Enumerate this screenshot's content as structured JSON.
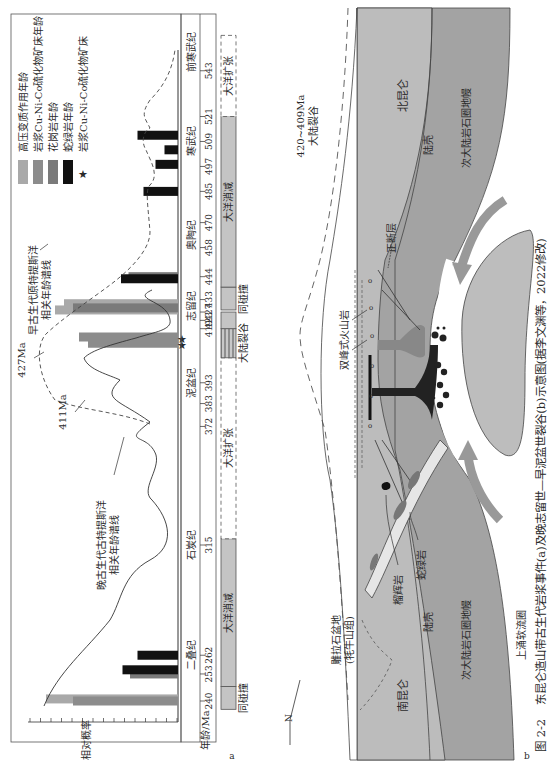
{
  "caption": {
    "figure_no": "图 2-2",
    "text": "东昆仑造山带古生代岩浆事件(a)及晚志留世—早泥盆世裂谷(b)示意图(据李文渊等，2022修改)"
  },
  "panel_a": {
    "label": "a",
    "legend": [
      {
        "label": "高压变质作用年龄",
        "color": "#a9a9a9",
        "kind": "bar"
      },
      {
        "label": "岩浆Cu-Ni-Co硫化物矿床年龄",
        "color": "#8c8c8c",
        "kind": "bar"
      },
      {
        "label": "花岗岩年龄",
        "color": "#7a7a7a",
        "kind": "bar"
      },
      {
        "label": "蛇绿岩年龄",
        "color": "#111111",
        "kind": "bar"
      },
      {
        "label": "岩浆Cu-Ni-Co硫化物矿床",
        "color": "#111111",
        "kind": "star"
      }
    ],
    "y_axis_label": "相对概率",
    "x_axis_label": "年龄/Ma",
    "annotations": {
      "peak_427": "427Ma",
      "peak_411": "411Ma",
      "early_curve": [
        "早古生代原特提斯洋",
        "相关年龄谱线"
      ],
      "late_curve": [
        "晚古生代古特提斯洋",
        "相关年龄谱线"
      ]
    },
    "age_ticks": [
      "240",
      "253",
      "262",
      "315",
      "372",
      "383",
      "393",
      "419",
      "423",
      "427",
      "433",
      "444",
      "458",
      "470",
      "485",
      "497",
      "509",
      "521",
      "543"
    ],
    "periods": [
      {
        "label": "二叠纪",
        "pos": 262
      },
      {
        "label": "石炭纪",
        "pos": 315
      },
      {
        "label": "泥盆纪",
        "pos": 393
      },
      {
        "label": "志留纪",
        "pos": 430
      },
      {
        "label": "奥陶纪",
        "pos": 464
      },
      {
        "label": "寒武纪",
        "pos": 509
      },
      {
        "label": "前寒武纪",
        "pos": 552
      }
    ],
    "tectonic_stages": [
      {
        "label": "同碰撞",
        "from": 236,
        "to": 247,
        "style": "box"
      },
      {
        "label": "大洋消减",
        "from": 247,
        "to": 318,
        "style": "filled"
      },
      {
        "label": "大洋扩张",
        "from": 318,
        "to": 405,
        "style": "dashed"
      },
      {
        "label": "大陆裂谷",
        "from": 405,
        "to": 419,
        "style": "hatched"
      },
      {
        "label": "",
        "from": 419,
        "to": 427,
        "style": "box"
      },
      {
        "label": "同碰撞",
        "from": 428,
        "to": 439,
        "style": "box"
      },
      {
        "label": "大洋消减",
        "from": 439,
        "to": 521,
        "style": "filled"
      },
      {
        "label": "大洋扩张",
        "from": 521,
        "to": 560,
        "style": "dashed"
      }
    ]
  },
  "chart_data": {
    "type": "bar",
    "title": "东昆仑造山带古生代岩浆事件",
    "xlabel": "年龄/Ma",
    "ylabel": "相对概率",
    "xlim": [
      236,
      560
    ],
    "series": [
      {
        "name": "高压变质作用年龄",
        "color": "#a9a9a9",
        "points": [
          {
            "age": 241,
            "value": 0.88
          },
          {
            "age": 428,
            "value": 0.82
          },
          {
            "age": 431,
            "value": 0.76
          }
        ]
      },
      {
        "name": "岩浆Cu-Ni-Co硫化物矿床年龄",
        "color": "#8c8c8c",
        "points": [
          {
            "age": 240,
            "value": 0.7
          },
          {
            "age": 412,
            "value": 0.6
          },
          {
            "age": 415,
            "value": 0.66
          }
        ]
      },
      {
        "name": "花岗岩年龄",
        "color": "#7a7a7a",
        "points": [
          {
            "age": 253,
            "value": 0.32
          },
          {
            "age": 429,
            "value": 0.7
          },
          {
            "age": 444,
            "value": 0.33
          }
        ]
      },
      {
        "name": "蛇绿岩年龄",
        "color": "#111111",
        "points": [
          {
            "age": 255,
            "value": 0.37
          },
          {
            "age": 262,
            "value": 0.27
          },
          {
            "age": 443,
            "value": 0.38
          },
          {
            "age": 485,
            "value": 0.23
          },
          {
            "age": 498,
            "value": 0.15
          },
          {
            "age": 505,
            "value": 0.09
          },
          {
            "age": 512,
            "value": 0.27
          }
        ]
      },
      {
        "name": "岩浆Cu-Ni-Co硫化物矿床",
        "marker": "star",
        "points": [
          {
            "age": 411
          },
          {
            "age": 414
          }
        ]
      }
    ],
    "curves": [
      {
        "name": "早古生代原特提斯洋相关年龄谱线",
        "style": "dashed",
        "peak": {
          "age": 427,
          "value": 0.95
        }
      },
      {
        "name": "晚古生代古特提斯洋相关年龄谱线",
        "style": "solid",
        "peak": {
          "age": 411,
          "value": 0.7
        }
      }
    ]
  },
  "panel_b": {
    "label": "b",
    "north_arrow": "N",
    "time_label": "420~409Ma",
    "event_label": "大陆裂谷",
    "labels": {
      "north_kunlun": "北昆仑",
      "south_kunlun": "南昆仑",
      "crust_n": "陆壳",
      "crust_s": "陆壳",
      "mantle_n": "次大陆岩石圈地幔",
      "mantle_s": "次大陆岩石圈地幔",
      "normal_fault": "正断层",
      "bimodal_volcanics": "双峰式火山岩",
      "ophiolite": "蛇绿岩",
      "eclogite": "榴辉岩",
      "basin": [
        "雕拉石盆地",
        "(牦牛山组)"
      ],
      "upwelling": "上涌软流圈"
    }
  }
}
